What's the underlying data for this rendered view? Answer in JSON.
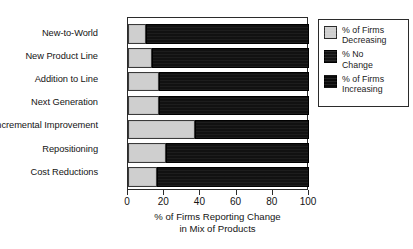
{
  "chart_data": {
    "type": "bar",
    "orientation": "horizontal",
    "stacked": true,
    "title": "",
    "xlabel": "% of Firms Reporting Change in Mix of Products",
    "xlabel_line1": "% of Firms Reporting Change",
    "xlabel_line2": "in Mix of Products",
    "ylabel": "",
    "xlim": [
      0,
      100
    ],
    "xticks": [
      0,
      20,
      40,
      60,
      80,
      100
    ],
    "xtick_labels": [
      "0",
      "20",
      "40",
      "60",
      "80",
      "100"
    ],
    "grid": false,
    "legend_position": "right-outside",
    "categories": [
      "New-to-World",
      "New Product Line",
      "Addition to Line",
      "Next Generation",
      "Incremental Improvement",
      "Repositioning",
      "Cost Reductions"
    ],
    "series": [
      {
        "name": "% of Firms Decreasing",
        "color": "#cfcfcf",
        "values": [
          10,
          13,
          17,
          17,
          37,
          21,
          16
        ]
      },
      {
        "name": "% No Change / % of Firms Increasing",
        "color": "#111111",
        "values": [
          90,
          87,
          83,
          83,
          63,
          79,
          84
        ]
      }
    ],
    "legend": [
      {
        "label_line1": "% of Firms",
        "label_line2": "Decreasing",
        "swatch": "light-gray"
      },
      {
        "label_line1": "% No",
        "label_line2": "Change",
        "swatch": "black"
      },
      {
        "label_line1": "% of Firms",
        "label_line2": "Increasing",
        "swatch": "black"
      }
    ]
  },
  "colors": {
    "decreasing": "#cfcfcf",
    "dark": "#111111",
    "axis": "#2b2b2b",
    "text": "#141414",
    "background": "#ffffff"
  }
}
